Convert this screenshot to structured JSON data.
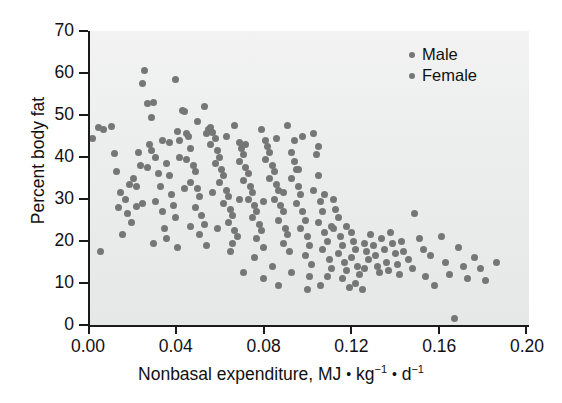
{
  "chart_data": {
    "type": "scatter",
    "title": "",
    "xlabel_parts": {
      "prefix": "Nonbasal expenditure, MJ ",
      "sep1": "•",
      "unit1": "kg",
      "exp1": "−1",
      "sep2": "•",
      "unit2": "d",
      "exp2": "−1"
    },
    "xlabel": "Nonbasal expenditure, MJ • kg−1 • d−1",
    "ylabel": "Percent body fat",
    "xlim": [
      0.0,
      0.2
    ],
    "ylim": [
      0,
      70
    ],
    "xticks": [
      "0.00",
      "0.04",
      "0.08",
      "0.12",
      "0.16",
      "0.20"
    ],
    "xtick_values": [
      0.0,
      0.04,
      0.08,
      0.12,
      0.16,
      0.2
    ],
    "yticks": [
      "0",
      "10",
      "20",
      "30",
      "40",
      "50",
      "60",
      "70"
    ],
    "ytick_values": [
      0,
      10,
      20,
      30,
      40,
      50,
      60,
      70
    ],
    "grid": false,
    "legend_position": "top-right",
    "marker_color": "#767676",
    "axis_color": "#1a1a1a",
    "plot_background": "#ececec",
    "legend": [
      {
        "label": "Male",
        "color": "#767676"
      },
      {
        "label": "Female",
        "color": "#767676"
      }
    ],
    "series": [
      {
        "name": "Male and Female subjects",
        "color": "#767676",
        "points": [
          [
            0.001,
            44.5
          ],
          [
            0.004,
            47.0
          ],
          [
            0.006,
            46.6
          ],
          [
            0.005,
            17.5
          ],
          [
            0.01,
            47.3
          ],
          [
            0.011,
            40.8
          ],
          [
            0.012,
            36.5
          ],
          [
            0.013,
            28.0
          ],
          [
            0.014,
            31.5
          ],
          [
            0.016,
            30.0
          ],
          [
            0.015,
            21.5
          ],
          [
            0.018,
            33.5
          ],
          [
            0.02,
            35.0
          ],
          [
            0.021,
            28.2
          ],
          [
            0.019,
            24.5
          ],
          [
            0.022,
            41.0
          ],
          [
            0.023,
            38.0
          ],
          [
            0.024,
            29.0
          ],
          [
            0.025,
            60.5
          ],
          [
            0.024,
            57.5
          ],
          [
            0.026,
            52.8
          ],
          [
            0.029,
            53.0
          ],
          [
            0.028,
            49.5
          ],
          [
            0.027,
            43.0
          ],
          [
            0.028,
            41.5
          ],
          [
            0.03,
            40.0
          ],
          [
            0.031,
            36.0
          ],
          [
            0.032,
            33.0
          ],
          [
            0.03,
            29.5
          ],
          [
            0.033,
            27.0
          ],
          [
            0.034,
            23.0
          ],
          [
            0.035,
            38.5
          ],
          [
            0.036,
            35.5
          ],
          [
            0.037,
            31.0
          ],
          [
            0.038,
            28.5
          ],
          [
            0.039,
            25.5
          ],
          [
            0.04,
            46.0
          ],
          [
            0.041,
            44.0
          ],
          [
            0.039,
            58.5
          ],
          [
            0.042,
            51.0
          ],
          [
            0.043,
            50.8
          ],
          [
            0.044,
            45.5
          ],
          [
            0.045,
            44.8
          ],
          [
            0.046,
            42.0
          ],
          [
            0.044,
            39.5
          ],
          [
            0.047,
            38.0
          ],
          [
            0.048,
            36.5
          ],
          [
            0.046,
            34.0
          ],
          [
            0.049,
            32.5
          ],
          [
            0.05,
            30.5
          ],
          [
            0.048,
            28.0
          ],
          [
            0.051,
            26.0
          ],
          [
            0.052,
            24.0
          ],
          [
            0.05,
            21.5
          ],
          [
            0.053,
            45.5
          ],
          [
            0.054,
            46.5
          ],
          [
            0.055,
            47.0
          ],
          [
            0.056,
            45.8
          ],
          [
            0.057,
            44.5
          ],
          [
            0.055,
            43.0
          ],
          [
            0.058,
            41.5
          ],
          [
            0.059,
            40.0
          ],
          [
            0.057,
            38.5
          ],
          [
            0.06,
            37.0
          ],
          [
            0.061,
            35.5
          ],
          [
            0.059,
            34.0
          ],
          [
            0.062,
            32.0
          ],
          [
            0.063,
            30.5
          ],
          [
            0.061,
            29.0
          ],
          [
            0.064,
            27.5
          ],
          [
            0.065,
            26.0
          ],
          [
            0.063,
            24.5
          ],
          [
            0.066,
            22.5
          ],
          [
            0.067,
            21.0
          ],
          [
            0.065,
            19.5
          ],
          [
            0.068,
            43.5
          ],
          [
            0.069,
            42.0
          ],
          [
            0.07,
            40.5
          ],
          [
            0.068,
            39.0
          ],
          [
            0.071,
            37.5
          ],
          [
            0.072,
            36.0
          ],
          [
            0.07,
            34.5
          ],
          [
            0.073,
            33.0
          ],
          [
            0.074,
            31.5
          ],
          [
            0.072,
            30.0
          ],
          [
            0.075,
            28.5
          ],
          [
            0.076,
            27.0
          ],
          [
            0.074,
            25.5
          ],
          [
            0.077,
            24.0
          ],
          [
            0.078,
            22.5
          ],
          [
            0.076,
            20.5
          ],
          [
            0.079,
            18.5
          ],
          [
            0.08,
            44.0
          ],
          [
            0.081,
            42.5
          ],
          [
            0.082,
            41.0
          ],
          [
            0.08,
            39.5
          ],
          [
            0.083,
            38.0
          ],
          [
            0.084,
            36.5
          ],
          [
            0.082,
            35.0
          ],
          [
            0.085,
            33.5
          ],
          [
            0.086,
            32.0
          ],
          [
            0.084,
            30.0
          ],
          [
            0.087,
            28.5
          ],
          [
            0.088,
            27.0
          ],
          [
            0.086,
            25.0
          ],
          [
            0.089,
            23.0
          ],
          [
            0.09,
            21.5
          ],
          [
            0.088,
            19.5
          ],
          [
            0.091,
            17.5
          ],
          [
            0.092,
            41.0
          ],
          [
            0.093,
            39.0
          ],
          [
            0.094,
            37.0
          ],
          [
            0.092,
            35.0
          ],
          [
            0.095,
            33.0
          ],
          [
            0.096,
            31.0
          ],
          [
            0.094,
            29.0
          ],
          [
            0.097,
            27.0
          ],
          [
            0.098,
            25.0
          ],
          [
            0.096,
            23.0
          ],
          [
            0.099,
            21.0
          ],
          [
            0.1,
            19.0
          ],
          [
            0.098,
            16.5
          ],
          [
            0.101,
            14.5
          ],
          [
            0.102,
            45.5
          ],
          [
            0.103,
            40.5
          ],
          [
            0.104,
            35.5
          ],
          [
            0.102,
            32.0
          ],
          [
            0.105,
            29.5
          ],
          [
            0.106,
            27.0
          ],
          [
            0.104,
            24.5
          ],
          [
            0.107,
            22.0
          ],
          [
            0.108,
            20.0
          ],
          [
            0.106,
            18.0
          ],
          [
            0.109,
            15.5
          ],
          [
            0.11,
            13.5
          ],
          [
            0.108,
            11.5
          ],
          [
            0.111,
            30.0
          ],
          [
            0.112,
            27.5
          ],
          [
            0.113,
            25.5
          ],
          [
            0.111,
            23.0
          ],
          [
            0.114,
            21.0
          ],
          [
            0.115,
            19.0
          ],
          [
            0.113,
            17.0
          ],
          [
            0.116,
            15.0
          ],
          [
            0.117,
            13.0
          ],
          [
            0.115,
            11.0
          ],
          [
            0.118,
            9.0
          ],
          [
            0.119,
            22.0
          ],
          [
            0.12,
            20.0
          ],
          [
            0.121,
            18.0
          ],
          [
            0.119,
            16.0
          ],
          [
            0.122,
            14.0
          ],
          [
            0.123,
            12.0
          ],
          [
            0.121,
            10.0
          ],
          [
            0.124,
            8.5
          ],
          [
            0.125,
            19.5
          ],
          [
            0.126,
            17.5
          ],
          [
            0.127,
            15.5
          ],
          [
            0.125,
            13.5
          ],
          [
            0.128,
            21.5
          ],
          [
            0.129,
            19.0
          ],
          [
            0.13,
            16.5
          ],
          [
            0.131,
            14.0
          ],
          [
            0.132,
            12.5
          ],
          [
            0.133,
            20.5
          ],
          [
            0.134,
            18.0
          ],
          [
            0.135,
            15.0
          ],
          [
            0.136,
            13.0
          ],
          [
            0.137,
            22.0
          ],
          [
            0.138,
            19.5
          ],
          [
            0.139,
            17.0
          ],
          [
            0.14,
            14.5
          ],
          [
            0.141,
            12.0
          ],
          [
            0.142,
            20.0
          ],
          [
            0.143,
            17.5
          ],
          [
            0.145,
            15.5
          ],
          [
            0.147,
            13.5
          ],
          [
            0.148,
            26.5
          ],
          [
            0.15,
            20.5
          ],
          [
            0.152,
            18.0
          ],
          [
            0.153,
            11.5
          ],
          [
            0.155,
            16.5
          ],
          [
            0.157,
            9.5
          ],
          [
            0.16,
            21.0
          ],
          [
            0.162,
            15.0
          ],
          [
            0.164,
            12.0
          ],
          [
            0.166,
            1.5
          ],
          [
            0.168,
            18.5
          ],
          [
            0.17,
            14.0
          ],
          [
            0.172,
            11.0
          ],
          [
            0.175,
            16.0
          ],
          [
            0.178,
            13.5
          ],
          [
            0.18,
            10.5
          ],
          [
            0.185,
            15.0
          ],
          [
            0.09,
            47.5
          ],
          [
            0.093,
            44.0
          ],
          [
            0.078,
            46.5
          ],
          [
            0.066,
            47.5
          ],
          [
            0.052,
            52.0
          ],
          [
            0.036,
            43.5
          ],
          [
            0.033,
            44.0
          ],
          [
            0.041,
            40.0
          ],
          [
            0.049,
            48.5
          ],
          [
            0.062,
            45.0
          ],
          [
            0.071,
            43.0
          ],
          [
            0.085,
            44.5
          ],
          [
            0.104,
            42.5
          ],
          [
            0.097,
            45.0
          ],
          [
            0.021,
            33.0
          ],
          [
            0.017,
            26.5
          ],
          [
            0.026,
            37.5
          ],
          [
            0.043,
            32.5
          ],
          [
            0.056,
            31.5
          ],
          [
            0.068,
            30.0
          ],
          [
            0.079,
            29.5
          ],
          [
            0.088,
            31.5
          ],
          [
            0.095,
            37.0
          ],
          [
            0.107,
            31.0
          ],
          [
            0.11,
            23.5
          ],
          [
            0.117,
            23.5
          ],
          [
            0.058,
            23.0
          ],
          [
            0.046,
            23.5
          ],
          [
            0.035,
            20.5
          ],
          [
            0.029,
            19.5
          ],
          [
            0.04,
            18.5
          ],
          [
            0.053,
            19.0
          ],
          [
            0.064,
            17.5
          ],
          [
            0.075,
            16.0
          ],
          [
            0.083,
            14.0
          ],
          [
            0.092,
            12.5
          ],
          [
            0.1,
            11.5
          ],
          [
            0.105,
            9.5
          ],
          [
            0.086,
            9.5
          ],
          [
            0.079,
            11.0
          ],
          [
            0.07,
            12.5
          ],
          [
            0.099,
            8.5
          ]
        ]
      }
    ]
  }
}
